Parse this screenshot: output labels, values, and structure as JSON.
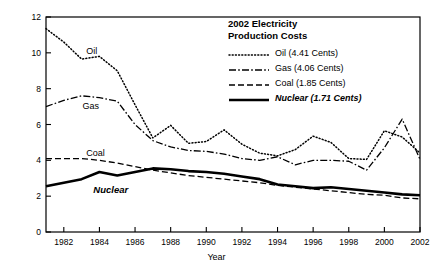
{
  "chart_data": {
    "type": "line",
    "title": "2002 Electricity Production Costs",
    "xlabel": "Year",
    "ylabel": "Cents/kWh\n(2002 Units)",
    "xlim": [
      1981,
      2002
    ],
    "ylim": [
      0,
      12
    ],
    "grid": false,
    "legend_position": "top-right",
    "xticks": [
      "1982",
      "1984",
      "1986",
      "1988",
      "1990",
      "1992",
      "1994",
      "1996",
      "1998",
      "2000",
      "2002"
    ],
    "xtick_values": [
      1982,
      1984,
      1986,
      1988,
      1990,
      1992,
      1994,
      1996,
      1998,
      2000,
      2002
    ],
    "yticks": [
      "0",
      "2",
      "4",
      "6",
      "8",
      "10",
      "12"
    ],
    "ytick_values": [
      0,
      2,
      4,
      6,
      8,
      10,
      12
    ],
    "x": [
      1981,
      1982,
      1983,
      1984,
      1985,
      1986,
      1987,
      1988,
      1989,
      1990,
      1991,
      1992,
      1993,
      1994,
      1995,
      1996,
      1997,
      1998,
      1999,
      2000,
      2001,
      2002
    ],
    "series": [
      {
        "name": "Oil",
        "legend_label": "Oil (4.41 Cents)",
        "value_2002": 4.41,
        "style": "dotted",
        "values": [
          11.35,
          10.6,
          9.65,
          9.8,
          9.0,
          7.1,
          5.25,
          5.95,
          4.95,
          5.05,
          5.7,
          4.9,
          4.4,
          4.25,
          4.6,
          5.35,
          5.0,
          4.1,
          4.05,
          5.65,
          5.3,
          4.41
        ]
      },
      {
        "name": "Gas",
        "legend_label": "Gas (4.06 Cents)",
        "value_2002": 4.06,
        "style": "dash-dot",
        "values": [
          7.0,
          7.35,
          7.6,
          7.5,
          7.3,
          6.0,
          5.1,
          4.75,
          4.55,
          4.5,
          4.35,
          4.1,
          4.0,
          4.2,
          3.75,
          4.0,
          4.0,
          3.95,
          3.45,
          4.7,
          6.3,
          4.06
        ]
      },
      {
        "name": "Coal",
        "legend_label": "Coal (1.85 Cents)",
        "value_2002": 1.85,
        "style": "dashed",
        "values": [
          4.1,
          4.1,
          4.1,
          4.0,
          3.85,
          3.65,
          3.45,
          3.3,
          3.15,
          3.05,
          2.95,
          2.85,
          2.75,
          2.6,
          2.5,
          2.4,
          2.3,
          2.2,
          2.1,
          2.05,
          1.9,
          1.85
        ]
      },
      {
        "name": "Nuclear",
        "legend_label": "Nuclear (1.71 Cents)",
        "value_2002": 1.71,
        "style": "solid-bold",
        "values": [
          2.55,
          2.75,
          2.95,
          3.35,
          3.15,
          3.35,
          3.55,
          3.5,
          3.4,
          3.35,
          3.25,
          3.1,
          2.95,
          2.65,
          2.55,
          2.45,
          2.5,
          2.4,
          2.3,
          2.2,
          2.1,
          2.05
        ]
      }
    ],
    "annotations": [
      {
        "label": "Oil",
        "x": 1983.2,
        "y": 10.05
      },
      {
        "label": "Gas",
        "x": 1983.0,
        "y": 6.95
      },
      {
        "label": "Coal",
        "x": 1983.2,
        "y": 4.35
      },
      {
        "label": "Nuclear",
        "x": 1983.6,
        "y": 2.35
      }
    ]
  },
  "legend": {
    "title": "2002 Electricity\nProduction Costs",
    "items": [
      {
        "label": "Oil (4.41 Cents)",
        "style": "dotted"
      },
      {
        "label": "Gas (4.06 Cents)",
        "style": "dash-dot"
      },
      {
        "label": "Coal (1.85 Cents)",
        "style": "dashed"
      },
      {
        "label": "Nuclear (1.71 Cents)",
        "style": "solid-bold"
      }
    ]
  },
  "colors": {
    "ink": "#000000",
    "background": "#ffffff"
  }
}
